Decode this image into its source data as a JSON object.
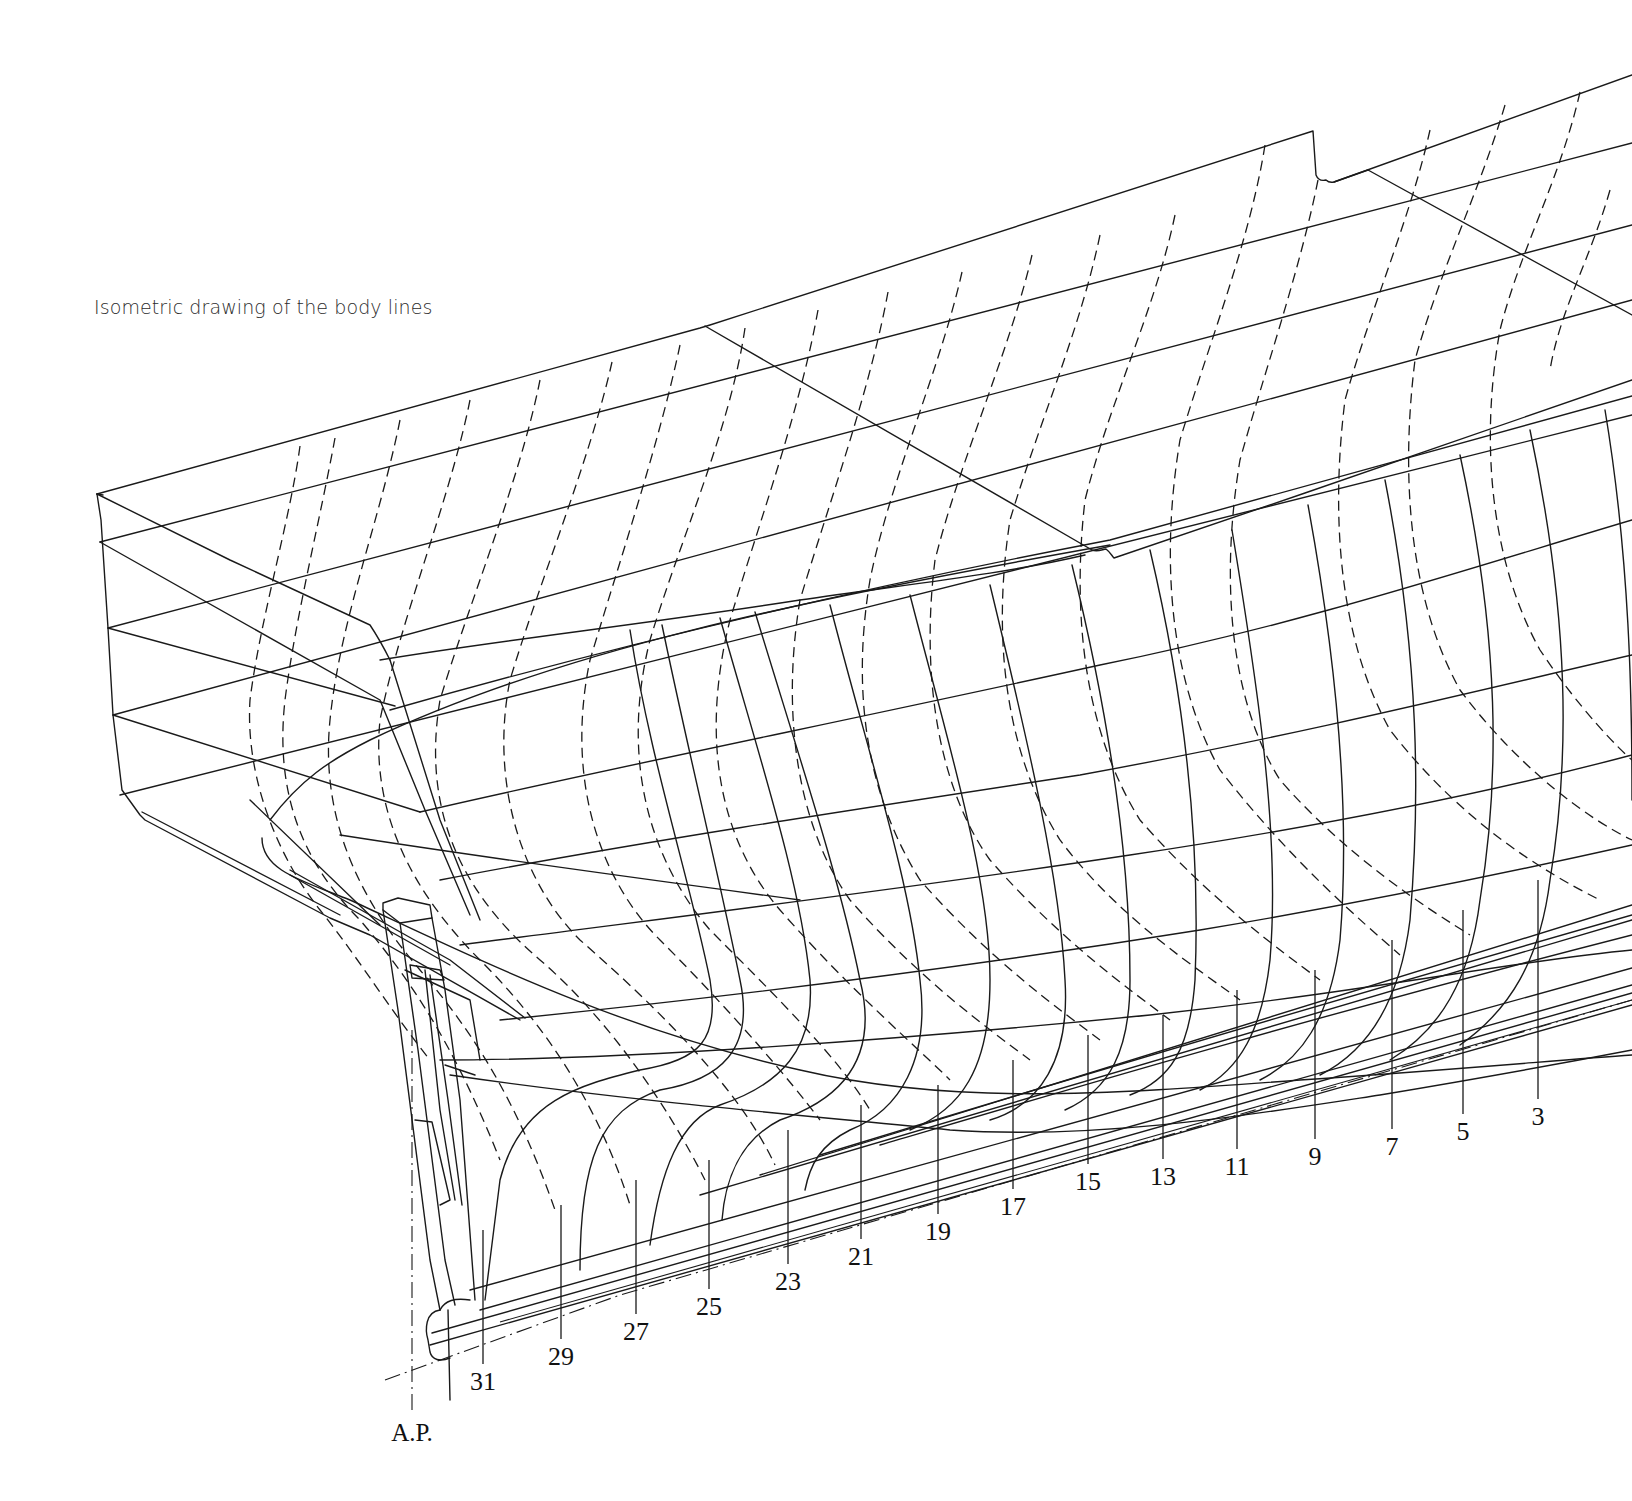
{
  "caption": "Isometric drawing of the body lines",
  "drawing": {
    "ink_color": "#1a1a1a",
    "background": "#ffffff",
    "aft_perpendicular_label": "A.P.",
    "station_labels": [
      {
        "label": "31",
        "x": 483,
        "y": 1390,
        "tick_top": 1230
      },
      {
        "label": "29",
        "x": 561,
        "y": 1365,
        "tick_top": 1205
      },
      {
        "label": "27",
        "x": 636,
        "y": 1340,
        "tick_top": 1180
      },
      {
        "label": "25",
        "x": 709,
        "y": 1315,
        "tick_top": 1160
      },
      {
        "label": "23",
        "x": 788,
        "y": 1290,
        "tick_top": 1130
      },
      {
        "label": "21",
        "x": 861,
        "y": 1265,
        "tick_top": 1105
      },
      {
        "label": "19",
        "x": 938,
        "y": 1240,
        "tick_top": 1085
      },
      {
        "label": "17",
        "x": 1013,
        "y": 1215,
        "tick_top": 1060
      },
      {
        "label": "15",
        "x": 1088,
        "y": 1190,
        "tick_top": 1035
      },
      {
        "label": "13",
        "x": 1163,
        "y": 1185,
        "tick_top": 1015
      },
      {
        "label": "11",
        "x": 1237,
        "y": 1175,
        "tick_top": 990
      },
      {
        "label": "9",
        "x": 1315,
        "y": 1165,
        "tick_top": 970
      },
      {
        "label": "7",
        "x": 1392,
        "y": 1155,
        "tick_top": 940
      },
      {
        "label": "5",
        "x": 1463,
        "y": 1140,
        "tick_top": 910
      },
      {
        "label": "3",
        "x": 1538,
        "y": 1125,
        "tick_top": 880
      }
    ],
    "ap_label_pos": {
      "x": 412,
      "y": 1441
    }
  }
}
